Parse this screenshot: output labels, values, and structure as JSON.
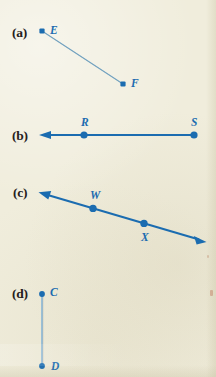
{
  "page": {
    "width": 216,
    "height": 377,
    "background_color": "#F0EDDC",
    "figure_color": "#1B6CB0",
    "thin_line_color": "#6FA8CF",
    "label_color": "#25201C"
  },
  "figures": [
    {
      "part_label": "(a)",
      "part_label_x": 12,
      "part_label_y": 26,
      "kind": "segment",
      "points": [
        {
          "name": "E",
          "x": 42,
          "y": 31,
          "label_x": 50,
          "label_y": 23
        },
        {
          "name": "F",
          "x": 123,
          "y": 84,
          "label_x": 131,
          "label_y": 76
        }
      ],
      "arrows": [],
      "stroke_width": 1.1,
      "dot_radius": 2.6,
      "line_color": "#6FA8CF"
    },
    {
      "part_label": "(b)",
      "part_label_x": 12,
      "part_label_y": 130,
      "kind": "ray",
      "points": [
        {
          "name": "R",
          "x": 84,
          "y": 135,
          "label_x": 80,
          "label_y": 117
        },
        {
          "name": "S",
          "x": 194,
          "y": 135,
          "label_x": 190,
          "label_y": 117
        }
      ],
      "arrows": [
        {
          "x": 40,
          "y": 135
        }
      ],
      "stroke_width": 2.1,
      "dot_radius": 3.6,
      "line_color": "#1B6CB0"
    },
    {
      "part_label": "(c)",
      "part_label_x": 12,
      "part_label_y": 192,
      "kind": "line",
      "points": [
        {
          "name": "W",
          "x": 93,
          "y": 208,
          "label_x": 89,
          "label_y": 190
        },
        {
          "name": "X",
          "x": 144,
          "y": 226,
          "label_x": 141,
          "label_y": 232
        }
      ],
      "arrows": [
        {
          "x": 40,
          "y": 193
        },
        {
          "x": 205,
          "y": 242
        }
      ],
      "stroke_width": 2.1,
      "dot_radius": 3.6,
      "line_color": "#1B6CB0"
    },
    {
      "part_label": "(d)",
      "part_label_x": 12,
      "part_label_y": 288,
      "kind": "segment",
      "points": [
        {
          "name": "C",
          "x": 42,
          "y": 294,
          "label_x": 50,
          "label_y": 287
        },
        {
          "name": "D",
          "x": 42,
          "y": 366,
          "label_x": 51,
          "label_y": 361
        }
      ],
      "arrows": [],
      "stroke_width": 1.4,
      "dot_radius": 2.9,
      "line_color": "#6FA8CF"
    }
  ],
  "part_labels": {
    "a": "(a)",
    "b": "(b)",
    "c": "(c)",
    "d": "(d)"
  },
  "point_names": {
    "E": "E",
    "F": "F",
    "R": "R",
    "S": "S",
    "W": "W",
    "X": "X",
    "C": "C",
    "D": "D"
  }
}
